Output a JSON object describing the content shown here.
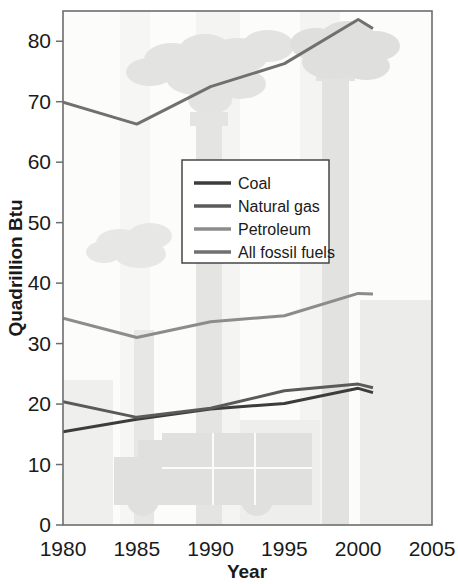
{
  "chart_data": {
    "type": "line",
    "title": "",
    "xlabel": "Year",
    "ylabel": "Quadrillion Btu",
    "xlim": [
      1980,
      2005
    ],
    "ylim": [
      0,
      85
    ],
    "xticks": [
      1980,
      1985,
      1990,
      1995,
      2000,
      2005
    ],
    "yticks": [
      0,
      10,
      20,
      30,
      40,
      50,
      60,
      70,
      80
    ],
    "grid": false,
    "legend_position": "center",
    "series": [
      {
        "name": "Coal",
        "color": "#3c3c3c",
        "x": [
          1980,
          1985,
          1990,
          1995,
          2000,
          2001
        ],
        "values": [
          15.4,
          17.5,
          19.2,
          20.1,
          22.6,
          21.9
        ]
      },
      {
        "name": "Natural gas",
        "color": "#5a5a5a",
        "x": [
          1980,
          1985,
          1990,
          1995,
          2000,
          2001
        ],
        "values": [
          20.4,
          17.8,
          19.3,
          22.2,
          23.3,
          22.7
        ]
      },
      {
        "name": "Petroleum",
        "color": "#8c8c8c",
        "x": [
          1980,
          1985,
          1990,
          1995,
          2000,
          2001
        ],
        "values": [
          34.2,
          31.0,
          33.6,
          34.6,
          38.3,
          38.2
        ]
      },
      {
        "name": "All fossil fuels",
        "color": "#707070",
        "x": [
          1980,
          1985,
          1990,
          1995,
          2000,
          2001
        ],
        "values": [
          69.9,
          66.3,
          72.5,
          76.3,
          83.6,
          82.1
        ]
      }
    ]
  },
  "axes": {
    "y_title": "Quadrillion Btu",
    "x_title": "Year",
    "y_tick_labels": [
      "80",
      "70",
      "60",
      "50",
      "40",
      "30",
      "20",
      "10",
      "0"
    ],
    "x_tick_labels": [
      "1980",
      "1985",
      "1990",
      "1995",
      "2000",
      "2005"
    ]
  },
  "legend": {
    "items": [
      {
        "label": "Coal",
        "color": "#3c3c3c"
      },
      {
        "label": "Natural gas",
        "color": "#5a5a5a"
      },
      {
        "label": "Petroleum",
        "color": "#8c8c8c"
      },
      {
        "label": "All fossil fuels",
        "color": "#707070"
      }
    ]
  },
  "watermark": {
    "description": "smokestacks-and-truck"
  },
  "colors": {
    "background": "#ffffff",
    "plot_background": "#fbfbfb",
    "frame": "#6d6d6d",
    "text": "#1a1a1a",
    "watermark_fill": "#e2e3e0"
  }
}
